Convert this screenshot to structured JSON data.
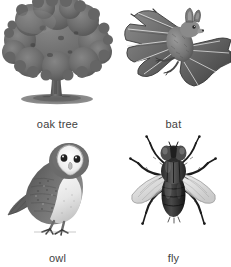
{
  "page": {
    "background_color": "#ffffff",
    "layout": "2x2-image-grid",
    "caption_color": "#3f3f3f"
  },
  "items": [
    {
      "id": "oak-tree",
      "label": "oak tree",
      "icon": "oak-tree-illustration",
      "position": "top-left",
      "style": "grayscale engraving",
      "primary_color": "#6b6b6b",
      "shadow_color": "#707070"
    },
    {
      "id": "bat",
      "label": "bat",
      "icon": "bat-illustration",
      "position": "top-right",
      "style": "grayscale engraving",
      "primary_color": "#5a5a5a",
      "shadow_color": "#888888"
    },
    {
      "id": "owl",
      "label": "owl",
      "icon": "owl-illustration",
      "position": "bottom-left",
      "style": "grayscale engraving",
      "primary_color": "#6a6a6a",
      "shadow_color": "#ededed"
    },
    {
      "id": "fly",
      "label": "fly",
      "icon": "fly-illustration",
      "position": "bottom-right",
      "style": "grayscale engraving",
      "primary_color": "#2e2e2e",
      "shadow_color": "#b9b9b9"
    }
  ]
}
